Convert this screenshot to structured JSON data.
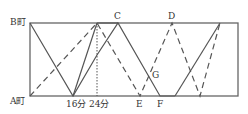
{
  "diagram": {
    "type": "travel-time graph",
    "labels": {
      "town_b": "B町",
      "town_a": "A町",
      "tick_16": "16分",
      "tick_24": "24分",
      "point_c": "C",
      "point_d": "D",
      "point_e": "E",
      "point_f": "F",
      "point_g": "G"
    },
    "colors": {
      "line": "#555555",
      "frame": "#666666",
      "text": "#333333"
    }
  }
}
